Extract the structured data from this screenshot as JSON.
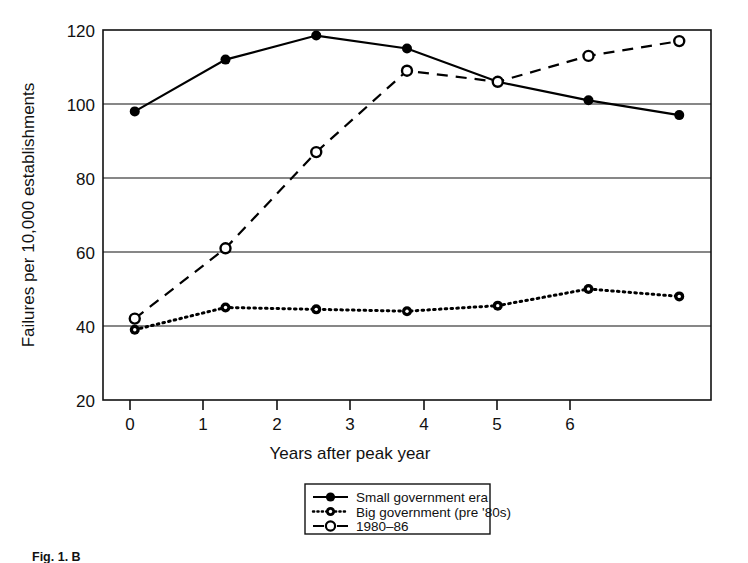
{
  "figure": {
    "caption": "Fig. 1. B"
  },
  "chart_data": {
    "type": "line",
    "title": "",
    "xlabel": "Years after peak year",
    "ylabel": "Failures per 10,000 establishments",
    "x": [
      0,
      1,
      2,
      3,
      4,
      5,
      6
    ],
    "xlim": [
      -0.35,
      6.35
    ],
    "ylim": [
      20,
      120
    ],
    "xticks": [
      0,
      1,
      2,
      3,
      4,
      5,
      6
    ],
    "xticklabels": [
      "0",
      "1",
      "2",
      "3",
      "4",
      "5",
      "6"
    ],
    "yticks": [
      20,
      40,
      60,
      80,
      100,
      120
    ],
    "yticklabels": [
      "20",
      "40",
      "60",
      "80",
      "100",
      "120"
    ],
    "grid": "horizontal",
    "legend_position": "below-center",
    "series": [
      {
        "name": "Small government era",
        "values": [
          98,
          112,
          118.5,
          115,
          106,
          101,
          97
        ],
        "linestyle": "solid",
        "marker": "filled-circle",
        "color": "#000000"
      },
      {
        "name": "Big government (pre '80s)",
        "values": [
          39,
          45,
          44.5,
          44,
          45.5,
          50,
          48
        ],
        "linestyle": "dotted",
        "marker": "filled-circle",
        "color": "#000000"
      },
      {
        "name": "1980–86",
        "values": [
          42,
          61,
          87,
          109,
          106,
          113,
          117
        ],
        "linestyle": "dashed",
        "marker": "open-circle",
        "color": "#000000"
      }
    ]
  },
  "legend": {
    "entries": [
      {
        "label": "Small government era"
      },
      {
        "label": "Big government (pre '80s)"
      },
      {
        "label": "1980–86"
      }
    ]
  }
}
